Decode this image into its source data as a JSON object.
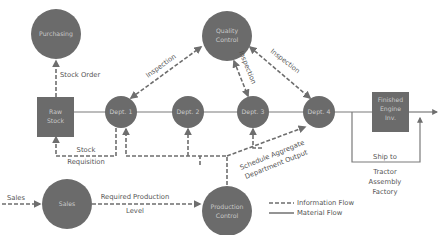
{
  "colors": {
    "node_fill": "#6b6b6b",
    "node_text": "#c9c9c9",
    "line": "#6e6e6e",
    "label_text": "#555555",
    "background": "#ffffff"
  },
  "nodes": {
    "purchasing": "Purchasing",
    "quality_control": [
      "Quality",
      "Control"
    ],
    "raw_stock": [
      "Raw",
      "Stock"
    ],
    "dept1": "Dept. 1",
    "dept2": "Dept. 2",
    "dept3": "Dept. 3",
    "dept4": "Dept. 4",
    "finished_engine_inv": [
      "Finished",
      "Engine",
      "Inv."
    ],
    "sales": "Sales",
    "production_control": [
      "Production",
      "Control"
    ]
  },
  "labels": {
    "stock_order": "Stock Order",
    "inspection_left": "Inspection",
    "inspection_mid": "Inspection",
    "inspection_right": "Inspection",
    "stock_requisition": [
      "Stock",
      "Requisition"
    ],
    "sales_input": "Sales",
    "required_production": [
      "Required Production",
      "Level"
    ],
    "schedule_aggregate": [
      "Schedule Aggregate",
      "Department Output"
    ],
    "ship_to": "Ship to",
    "destination": [
      "Tractor",
      "Assembly",
      "Factory"
    ]
  },
  "legend": {
    "information_flow": "Information Flow",
    "material_flow": "Material Flow"
  }
}
